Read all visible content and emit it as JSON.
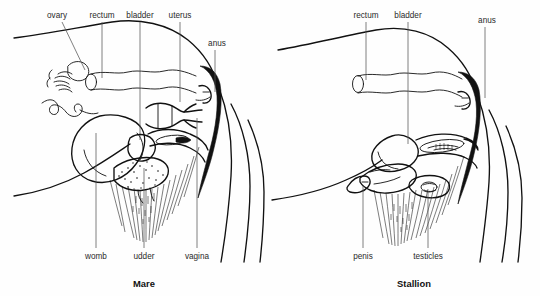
{
  "figure": {
    "background_color": "#fefefe",
    "ink_color": "#111111",
    "label_color": "#2a2a2a",
    "panel_count": 2
  },
  "mare": {
    "caption": "Mare",
    "caption_x": 144,
    "top_labels": [
      {
        "text": "ovary",
        "x": 57,
        "y": 18,
        "leader_x1": 62,
        "leader_y1": 22,
        "leader_x2": 85,
        "leader_y2": 70
      },
      {
        "text": "rectum",
        "x": 102,
        "y": 18,
        "leader_x1": 102,
        "leader_y1": 22,
        "leader_x2": 102,
        "leader_y2": 78
      },
      {
        "text": "bladder",
        "x": 140,
        "y": 18,
        "leader_x1": 140,
        "leader_y1": 22,
        "leader_x2": 140,
        "leader_y2": 140
      },
      {
        "text": "uterus",
        "x": 180,
        "y": 18,
        "leader_x1": 180,
        "leader_y1": 22,
        "leader_x2": 180,
        "leader_y2": 102
      },
      {
        "text": "anus",
        "x": 217,
        "y": 46,
        "leader_x1": 215,
        "leader_y1": 50,
        "leader_x2": 215,
        "leader_y2": 92
      }
    ],
    "bottom_labels": [
      {
        "text": "womb",
        "x": 96,
        "y": 259,
        "leader_x1": 96,
        "leader_y1": 248,
        "leader_x2": 96,
        "leader_y2": 133
      },
      {
        "text": "udder",
        "x": 144,
        "y": 259,
        "leader_x1": 144,
        "leader_y1": 248,
        "leader_x2": 144,
        "leader_y2": 168
      },
      {
        "text": "vagina",
        "x": 197,
        "y": 259,
        "leader_x1": 197,
        "leader_y1": 248,
        "leader_x2": 197,
        "leader_y2": 118
      }
    ]
  },
  "stallion": {
    "caption": "Stallion",
    "caption_x": 414,
    "top_labels": [
      {
        "text": "rectum",
        "x": 366,
        "y": 18,
        "leader_x1": 366,
        "leader_y1": 22,
        "leader_x2": 366,
        "leader_y2": 78
      },
      {
        "text": "bladder",
        "x": 408,
        "y": 18,
        "leader_x1": 408,
        "leader_y1": 22,
        "leader_x2": 408,
        "leader_y2": 142
      },
      {
        "text": "anus",
        "x": 487,
        "y": 23,
        "leader_x1": 485,
        "leader_y1": 27,
        "leader_x2": 485,
        "leader_y2": 98
      }
    ],
    "bottom_labels": [
      {
        "text": "penis",
        "x": 363,
        "y": 259,
        "leader_x1": 363,
        "leader_y1": 248,
        "leader_x2": 363,
        "leader_y2": 182
      },
      {
        "text": "testicles",
        "x": 428,
        "y": 259,
        "leader_x1": 428,
        "leader_y1": 248,
        "leader_x2": 428,
        "leader_y2": 188
      }
    ]
  }
}
